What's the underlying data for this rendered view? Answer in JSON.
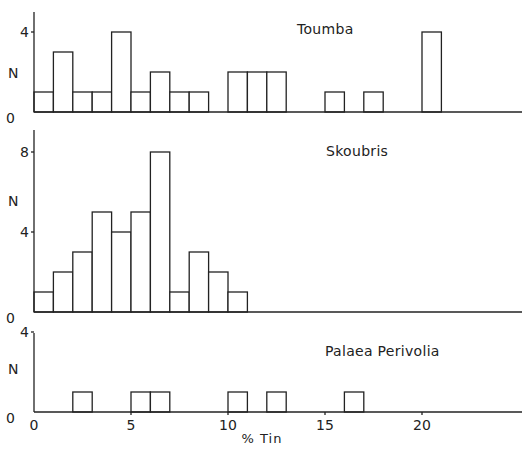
{
  "chart_data": {
    "type": "bar",
    "title": "",
    "xlabel": "% Tin",
    "ylabel": "N",
    "xlim": [
      0,
      25
    ],
    "x_ticks": [
      0,
      5,
      10,
      15,
      20
    ],
    "bin_width": 1,
    "grid": false,
    "legend": null,
    "panels": [
      {
        "name": "Toumba",
        "ylim": [
          0,
          5
        ],
        "y_ticks": [
          0,
          4
        ],
        "bins": [
          {
            "x": 0,
            "count": 1
          },
          {
            "x": 1,
            "count": 3
          },
          {
            "x": 2,
            "count": 1
          },
          {
            "x": 3,
            "count": 1
          },
          {
            "x": 4,
            "count": 4
          },
          {
            "x": 5,
            "count": 1
          },
          {
            "x": 6,
            "count": 2
          },
          {
            "x": 7,
            "count": 1
          },
          {
            "x": 8,
            "count": 1
          },
          {
            "x": 10,
            "count": 2
          },
          {
            "x": 11,
            "count": 2
          },
          {
            "x": 12,
            "count": 2
          },
          {
            "x": 15,
            "count": 1
          },
          {
            "x": 17,
            "count": 1
          },
          {
            "x": 20,
            "count": 4
          }
        ]
      },
      {
        "name": "Skoubris",
        "ylim": [
          0,
          9
        ],
        "y_ticks": [
          0,
          4,
          8
        ],
        "bins": [
          {
            "x": 0,
            "count": 1
          },
          {
            "x": 1,
            "count": 2
          },
          {
            "x": 2,
            "count": 3
          },
          {
            "x": 3,
            "count": 5
          },
          {
            "x": 4,
            "count": 4
          },
          {
            "x": 5,
            "count": 5
          },
          {
            "x": 6,
            "count": 8
          },
          {
            "x": 7,
            "count": 1
          },
          {
            "x": 8,
            "count": 3
          },
          {
            "x": 9,
            "count": 2
          },
          {
            "x": 10,
            "count": 1
          }
        ]
      },
      {
        "name": "Palaea Perivolia",
        "ylim": [
          0,
          4
        ],
        "y_ticks": [
          0,
          4
        ],
        "bins": [
          {
            "x": 2,
            "count": 1
          },
          {
            "x": 5,
            "count": 1
          },
          {
            "x": 6,
            "count": 1
          },
          {
            "x": 10,
            "count": 1
          },
          {
            "x": 12,
            "count": 1
          },
          {
            "x": 16,
            "count": 1
          }
        ]
      }
    ]
  },
  "labels": {
    "y_axis": "N",
    "x_axis": "% Tin",
    "panel_titles": [
      "Toumba",
      "Skoubris",
      "Palaea   Perivolia"
    ]
  }
}
